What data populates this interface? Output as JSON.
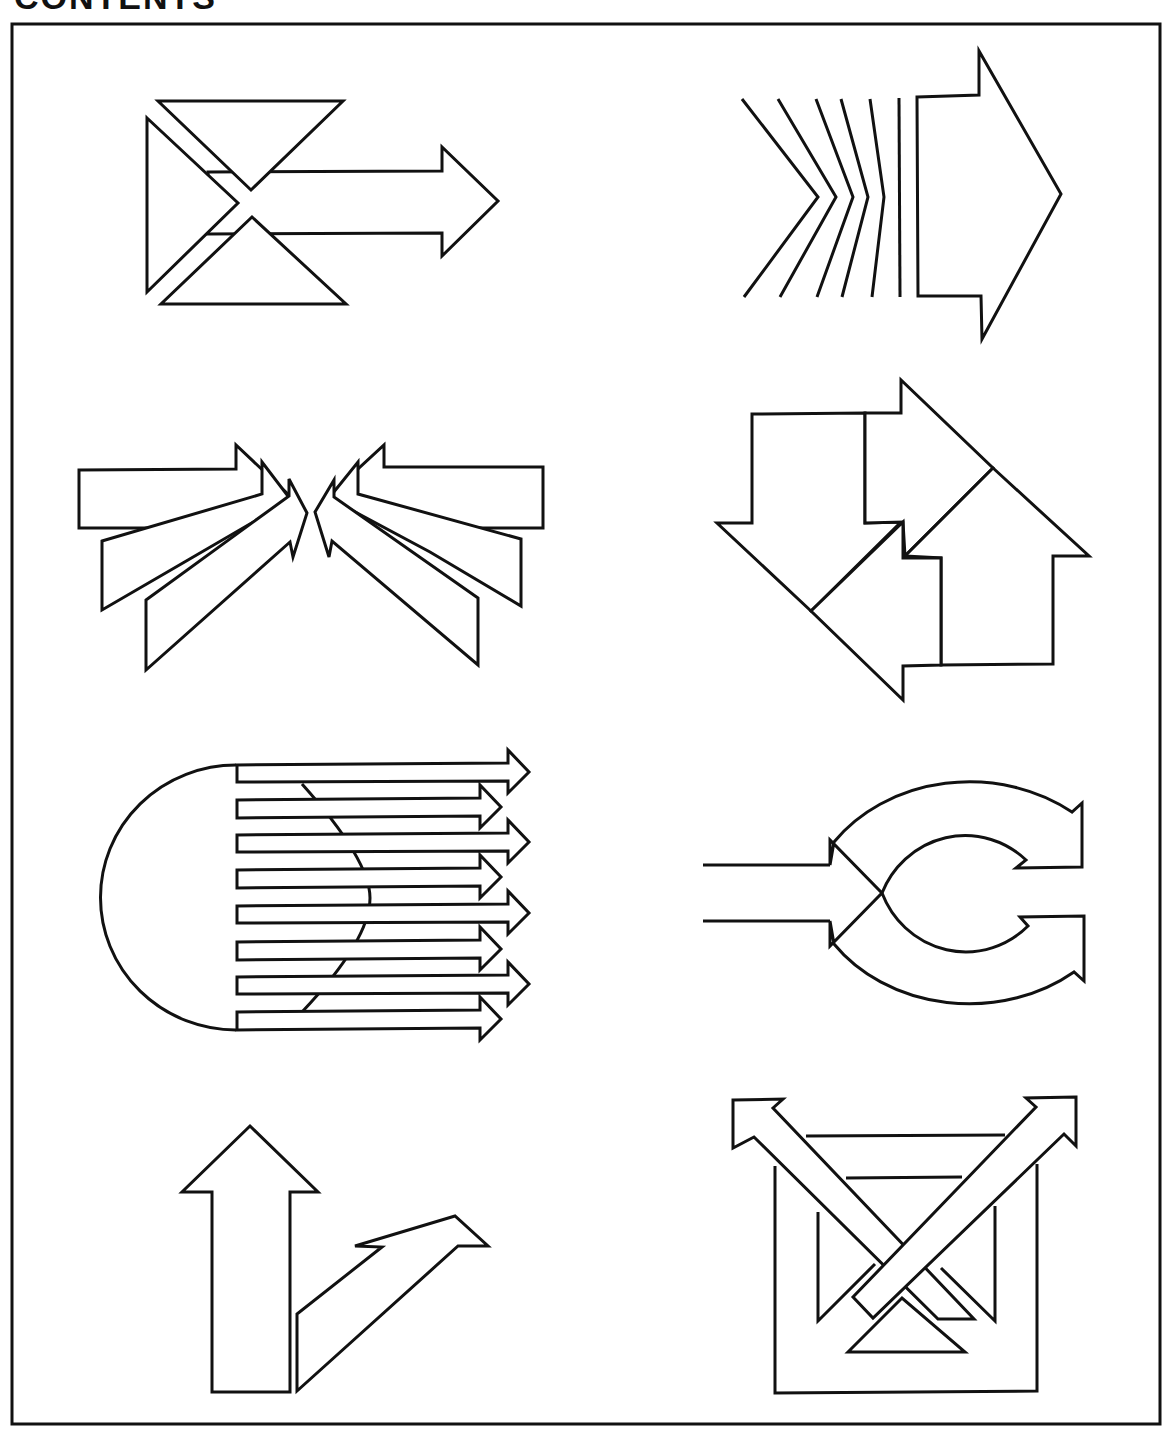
{
  "page": {
    "heading_fragment": "CONTENTS",
    "frame": {
      "x": 12,
      "y": 24,
      "width": 1148,
      "height": 1400,
      "stroke": "#111111",
      "background": "#ffffff"
    }
  },
  "figures": [
    {
      "id": 1,
      "name": "arrow-through-hourglass",
      "position": "row1-left",
      "description": "Right-pointing block arrow passing between two triangles forming an hourglass, with a left triangle"
    },
    {
      "id": 2,
      "name": "chevron-lines-to-block-arrow",
      "position": "row1-right",
      "description": "Five chevron lines straightening into a vertical line, followed by a large right-pointing block arrow"
    },
    {
      "id": 3,
      "name": "converging-arrows",
      "position": "row2-left",
      "description": "Three arrows from left and three arrows from right converging to a central point"
    },
    {
      "id": 4,
      "name": "interlocking-cycle-arrows",
      "position": "row2-right",
      "description": "Four block arrows (down, right, up, left) interlocking in a diamond cycle"
    },
    {
      "id": 5,
      "name": "parallel-arrows-from-semicircle",
      "position": "row3-left",
      "description": "Eight horizontal arrows emerging from a semicircle, alternating lengths"
    },
    {
      "id": 6,
      "name": "split-circular-arrows",
      "position": "row3-right",
      "description": "Input channel splitting into two circular arrows curling around a C shape"
    },
    {
      "id": 7,
      "name": "branching-up-arrows",
      "position": "row4-left",
      "description": "Vertical upward arrow with a second arrow branching up and to the right"
    },
    {
      "id": 8,
      "name": "crossing-arrows-in-box",
      "position": "row4-right",
      "description": "Two diagonal arrows crossing in an X over a rectangular frame with inner triangles"
    }
  ],
  "colors": {
    "line": "#111111",
    "paper": "#ffffff"
  }
}
